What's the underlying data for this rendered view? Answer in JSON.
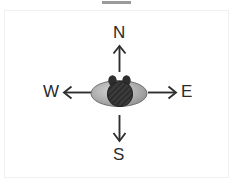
{
  "figure": {
    "type": "compass-orientation-diagram",
    "background_color": "#ffffff",
    "frame_color": "#f0f0f0",
    "top_bar_color": "#9a9a9a",
    "label_color": "#2b2b2b",
    "arrow_color": "#2f2f2f"
  },
  "compass": {
    "directions": [
      {
        "key": "north",
        "label": "N",
        "arrow": "arrow-up-icon",
        "position": "top"
      },
      {
        "key": "east",
        "label": "E",
        "arrow": "arrow-right-icon",
        "position": "right"
      },
      {
        "key": "south",
        "label": "S",
        "arrow": "arrow-down-icon",
        "position": "bottom"
      },
      {
        "key": "west",
        "label": "W",
        "arrow": "arrow-left-icon",
        "position": "left"
      }
    ]
  },
  "subject": {
    "name": "animal-top-view",
    "body_shape": "ellipse",
    "body_fill": "#a8a8a8",
    "body_outline": "#6e6e6e",
    "body_highlight": "#d2d2d2",
    "head_shape": "circle",
    "head_fill": "#3a3a3a",
    "head_texture": "crosshatch",
    "ears": 2,
    "ear_fill": "#2e2e2e"
  }
}
